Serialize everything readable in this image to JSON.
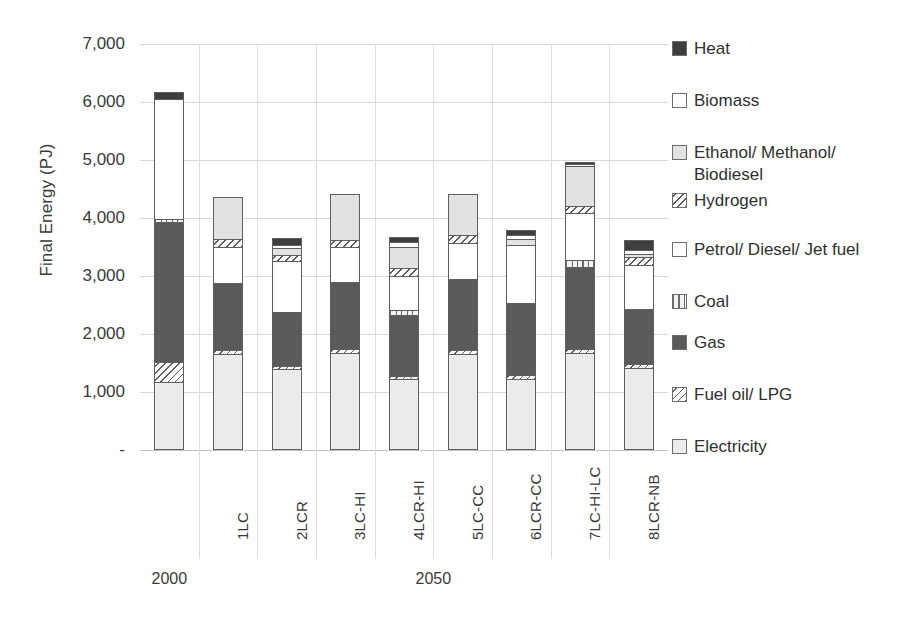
{
  "chart_data": {
    "type": "bar",
    "subtype": "stacked-vertical",
    "title": "",
    "xlabel": "",
    "ylabel": "Final Energy (PJ)",
    "ylim": [
      0,
      7000
    ],
    "ytick_step": 1000,
    "ytick_labels": [
      "7,000",
      "6,000",
      "5,000",
      "4,000",
      "3,000",
      "2,000",
      "1,000",
      "-"
    ],
    "ytick_values": [
      7000,
      6000,
      5000,
      4000,
      3000,
      2000,
      1000,
      0
    ],
    "grid": true,
    "grid_axis": "y",
    "legend_position": "right",
    "categories": [
      "",
      "1LC",
      "2LCR",
      "3LC-HI",
      "4LCR-HI",
      "5LC-CC",
      "6LCR-CC",
      "7LC-HI-LC",
      "8LCR-NB"
    ],
    "groups": [
      {
        "label": "2000",
        "categories": [
          ""
        ]
      },
      {
        "label": "2050",
        "categories": [
          "1LC",
          "2LCR",
          "3LC-HI",
          "4LCR-HI",
          "5LC-CC",
          "6LCR-CC",
          "7LC-HI-LC",
          "8LCR-NB"
        ]
      }
    ],
    "stack_order_bottom_to_top": [
      "Electricity",
      "Fuel oil/ LPG",
      "Gas",
      "Coal",
      "Petrol/ Diesel/ Jet fuel",
      "Hydrogen",
      "Ethanol/ Methanol/ Biodiesel",
      "Biomass",
      "Heat"
    ],
    "series": [
      {
        "name": "Electricity",
        "fill": "electricity",
        "color": "#ececec",
        "values": [
          1180,
          1660,
          1390,
          1670,
          1220,
          1650,
          1230,
          1670,
          1410
        ]
      },
      {
        "name": "Fuel oil/ LPG",
        "fill": "fueloil",
        "color": "#fdfdfd",
        "values": [
          330,
          70,
          60,
          70,
          60,
          70,
          60,
          80,
          80
        ]
      },
      {
        "name": "Gas",
        "fill": "gas",
        "color": "#5a5a5a",
        "values": [
          2420,
          1150,
          930,
          1150,
          1040,
          1230,
          1240,
          1410,
          940
        ]
      },
      {
        "name": "Coal",
        "fill": "coal",
        "color": "#f2f2f2",
        "values": [
          60,
          0,
          0,
          0,
          100,
          0,
          0,
          110,
          0
        ]
      },
      {
        "name": "Petrol/ Diesel/ Jet fuel",
        "fill": "petrol",
        "color": "#ffffff",
        "values": [
          0,
          620,
          880,
          610,
          580,
          620,
          1010,
          820,
          760
        ]
      },
      {
        "name": "Hydrogen",
        "fill": "hydrogen",
        "color": "#fdfdfd",
        "values": [
          0,
          130,
          110,
          120,
          140,
          130,
          0,
          120,
          130
        ]
      },
      {
        "name": "Ethanol/ Methanol/ Biodiesel",
        "fill": "ethanol",
        "color": "#e2e2e2",
        "values": [
          0,
          740,
          110,
          800,
          360,
          720,
          100,
          690,
          60
        ]
      },
      {
        "name": "Biomass",
        "fill": "biomass",
        "color": "#ffffff",
        "values": [
          2060,
          0,
          60,
          0,
          80,
          0,
          60,
          30,
          70
        ]
      },
      {
        "name": "Heat",
        "fill": "heat",
        "color": "#3f3f3f",
        "values": [
          130,
          0,
          120,
          0,
          90,
          0,
          90,
          40,
          170
        ]
      }
    ],
    "totals": [
      6180,
      4370,
      3660,
      4420,
      3670,
      4420,
      3790,
      4970,
      3620
    ]
  },
  "legend": {
    "items": [
      {
        "label": "Heat",
        "fill": "heat"
      },
      {
        "label": "Biomass",
        "fill": "biomass"
      },
      {
        "label": "Ethanol/ Methanol/ Biodiesel",
        "fill": "ethanol"
      },
      {
        "label": "Hydrogen",
        "fill": "hydrogen"
      },
      {
        "label": "Petrol/ Diesel/ Jet fuel",
        "fill": "petrol"
      },
      {
        "label": "Coal",
        "fill": "coal"
      },
      {
        "label": "Gas",
        "fill": "gas"
      },
      {
        "label": "Fuel oil/ LPG",
        "fill": "fueloil"
      },
      {
        "label": "Electricity",
        "fill": "electricity"
      }
    ]
  }
}
